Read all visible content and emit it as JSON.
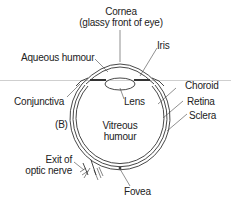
{
  "diagram": {
    "panel_label": "(B)",
    "labels": {
      "cornea_line1": "Cornea",
      "cornea_line2": "(glassy front of eye)",
      "iris": "Iris",
      "aqueous_humour": "Aqueous humour",
      "choroid": "Choroid",
      "conjunctiva": "Conjunctiva",
      "lens": "Lens",
      "retina": "Retina",
      "sclera": "Sclera",
      "vitreous_line1": "Vitreous",
      "vitreous_line2": "humour",
      "optic_line1": "Exit of",
      "optic_line2": "optic nerve",
      "fovea": "Fovea"
    },
    "colors": {
      "line": "#333333",
      "text": "#222222",
      "background": "#ffffff"
    }
  }
}
